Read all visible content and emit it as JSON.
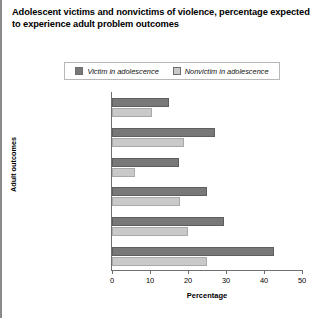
{
  "chart_data": {
    "type": "bar",
    "orientation": "horizontal",
    "title": "Adolescent victims and nonvictims of violence, percentage expected to experience adult problem outcomes",
    "xlabel": "Percentage",
    "ylabel": "Adult outcomes",
    "xlim": [
      0,
      50
    ],
    "xticks": [
      0,
      10,
      20,
      30,
      40,
      50
    ],
    "grid": false,
    "legend_position": "top-center",
    "categories": [
      "Posttraumatic stress disorder",
      "Problem drug use",
      "Property offending",
      "Violent offending",
      "Domestic violence victimization",
      "Violent victimization"
    ],
    "category_lines": [
      [
        "Posttraumatic",
        "stress disorder"
      ],
      [
        "Problem drug use"
      ],
      [
        "Property offending"
      ],
      [
        "Violent offending"
      ],
      [
        "Domestic violence",
        "victimization"
      ],
      [
        "Violent victimization"
      ]
    ],
    "series": [
      {
        "name": "Victim in adolescence",
        "color": "#787878",
        "values": [
          15,
          27,
          17.5,
          25,
          29.5,
          42.5
        ]
      },
      {
        "name": "Nonvictim in adolescence",
        "color": "#c9c9c9",
        "values": [
          10.5,
          19,
          6,
          18,
          20,
          25
        ]
      }
    ]
  },
  "legend": {
    "items": [
      {
        "label": "Victim in adolescence",
        "color": "#787878"
      },
      {
        "label": "Nonvictim in adolescence",
        "color": "#c9c9c9"
      }
    ]
  },
  "axis": {
    "x_title": "Percentage",
    "y_title": "Adult outcomes",
    "x_tick_labels": [
      "0",
      "10",
      "20",
      "30",
      "40",
      "50"
    ]
  }
}
